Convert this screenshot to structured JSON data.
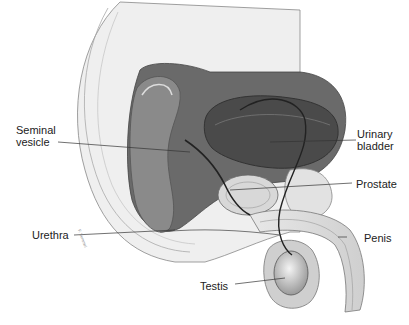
{
  "diagram": {
    "labels": [
      {
        "id": "seminal-vesicle",
        "line1": "Seminal",
        "line2": "vesicle"
      },
      {
        "id": "urinary-bladder",
        "line1": "Urinary",
        "line2": "bladder"
      },
      {
        "id": "prostate",
        "text": "Prostate"
      },
      {
        "id": "urethra",
        "text": "Urethra"
      },
      {
        "id": "penis",
        "text": "Penis"
      },
      {
        "id": "testis",
        "text": "Testis"
      }
    ],
    "signature": "F. Semmel"
  }
}
